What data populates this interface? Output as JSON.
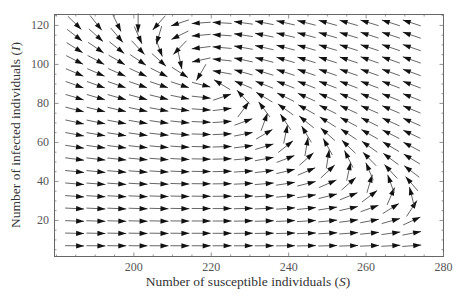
{
  "chart_data": {
    "type": "quiver",
    "title": "",
    "xlabel": "Number of susceptible individuals",
    "xlabel_var": "S",
    "ylabel": "Number of infected individuals",
    "ylabel_var": "I",
    "xlim": [
      179.5,
      280
    ],
    "ylim": [
      1.5,
      125.6
    ],
    "xticks": [
      200,
      220,
      240,
      260,
      280
    ],
    "yticks": [
      20,
      40,
      60,
      80,
      100,
      120
    ],
    "x_minor_step": 5,
    "y_minor_step": 5,
    "grid": false,
    "legend": null,
    "field": {
      "description": "Phase-plane direction field of an SIR-type model; arrows normalized in length",
      "grid_S": [
        184.7,
        190.2,
        195.6,
        201.1,
        206.5,
        211.9,
        217.4,
        222.8,
        228.3,
        233.7,
        239.2,
        244.6,
        250.1,
        255.5,
        260.9,
        266.4,
        271.8
      ],
      "grid_I": [
        7,
        13.4,
        19.7,
        26.1,
        32.4,
        38.8,
        45.1,
        51.5,
        57.8,
        64.2,
        70.5,
        76.9,
        83.2,
        89.6,
        95.9,
        102.3,
        108.6,
        115,
        121.3
      ],
      "dS_equation": "Lambda - S*(beta*I + mu)",
      "dI_equation": "k*I*(S - S_threshold)",
      "params": {
        "Lambda": 70225,
        "beta": 1,
        "mu": 228,
        "k": 260,
        "S_threshold": 220
      },
      "regions": [
        {
          "area": "S < 220, upper",
          "direction": "down-right"
        },
        {
          "area": "S > 220, upper",
          "direction": "up-left"
        },
        {
          "area": "S 240-275, I 25-60",
          "direction": "up"
        },
        {
          "area": "I < 20",
          "direction": "right"
        }
      ]
    }
  },
  "axes": {
    "x_label_text": "Number of susceptible individuals (",
    "x_label_var": "S",
    "x_label_close": ")",
    "y_label_text": "Number of infected individuals (",
    "y_label_var": "I",
    "y_label_close": ")"
  },
  "colors": {
    "arrow_head": "#111111",
    "arrow_shaft": "#555555",
    "frame": "#666666",
    "text": "#333333"
  }
}
